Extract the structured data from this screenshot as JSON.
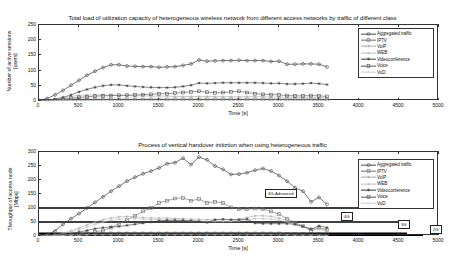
{
  "figure": {
    "background": "#ffffff",
    "axis_color": "#333333",
    "series_colors": {
      "aggregated": "#4a4a4a",
      "iptv": "#6f6f6f",
      "voip": "#a8a8a8",
      "web": "#bdbdbd",
      "videoconference": "#3a3a3a",
      "voice": "#555555",
      "vod": "#cccccc"
    }
  },
  "legend_labels": [
    "Aggregated traffic",
    "IPTV",
    "VoIP",
    "WEB",
    "Videoconference",
    "Voice",
    "VoD"
  ],
  "chart_data": [
    {
      "id": "top",
      "type": "line",
      "title": "Total load of utilization capacity of heterogeneous wireless network from different access networks by traffic of different class",
      "xlabel": "Time [s]",
      "ylabel": "Number of active sessions [users]",
      "ylabel_line1": "Number of active sessions",
      "ylabel_line2": "[users]",
      "xlim": [
        0,
        5000
      ],
      "ylim": [
        0,
        250
      ],
      "xticks": [
        0,
        500,
        1000,
        1500,
        2000,
        2500,
        3000,
        3500,
        4000,
        4500,
        5000
      ],
      "yticks": [
        0,
        50,
        100,
        150,
        200,
        250
      ],
      "grid": false,
      "legend_position": "upper right",
      "x": [
        0,
        100,
        200,
        300,
        400,
        500,
        600,
        700,
        800,
        900,
        1000,
        1100,
        1200,
        1300,
        1400,
        1500,
        1600,
        1700,
        1800,
        1900,
        2000,
        2100,
        2200,
        2300,
        2400,
        2500,
        2600,
        2700,
        2800,
        2900,
        3000,
        3100,
        3200,
        3300,
        3400,
        3500,
        3600
      ],
      "series": [
        {
          "name": "Aggregated traffic",
          "marker": "circle",
          "values": [
            2,
            8,
            20,
            35,
            52,
            68,
            85,
            98,
            110,
            119,
            119,
            115,
            114,
            113,
            113,
            111,
            112,
            113,
            117,
            122,
            135,
            131,
            132,
            133,
            133,
            134,
            133,
            133,
            133,
            130,
            131,
            121,
            121,
            122,
            122,
            121,
            112
          ]
        },
        {
          "name": "IPTV",
          "marker": "square",
          "values": [
            0,
            1,
            1,
            2,
            2,
            3,
            3,
            4,
            4,
            4,
            4,
            4,
            4,
            4,
            4,
            4,
            4,
            5,
            5,
            5,
            5,
            5,
            5,
            5,
            5,
            5,
            5,
            5,
            5,
            5,
            5,
            4,
            4,
            4,
            4,
            4,
            3
          ]
        },
        {
          "name": "VoIP",
          "marker": "plus",
          "values": [
            0,
            2,
            5,
            10,
            15,
            18,
            20,
            20,
            20,
            19,
            18,
            18,
            17,
            17,
            16,
            16,
            16,
            15,
            15,
            15,
            15,
            15,
            14,
            14,
            14,
            14,
            14,
            14,
            14,
            13,
            13,
            12,
            12,
            12,
            12,
            12,
            10
          ]
        },
        {
          "name": "WEB",
          "marker": "plus",
          "values": [
            0,
            1,
            3,
            5,
            7,
            9,
            10,
            10,
            10,
            10,
            10,
            10,
            10,
            9,
            9,
            9,
            9,
            9,
            9,
            9,
            9,
            9,
            9,
            9,
            9,
            9,
            9,
            9,
            9,
            8,
            8,
            8,
            8,
            8,
            8,
            8,
            7
          ]
        },
        {
          "name": "Videoconference",
          "marker": "star",
          "values": [
            0,
            2,
            6,
            12,
            20,
            30,
            38,
            45,
            50,
            53,
            53,
            50,
            48,
            46,
            45,
            44,
            44,
            45,
            48,
            52,
            59,
            58,
            59,
            60,
            60,
            60,
            60,
            60,
            59,
            58,
            58,
            56,
            56,
            57,
            59,
            57,
            54
          ]
        },
        {
          "name": "Voice",
          "marker": "square-open",
          "values": [
            0,
            1,
            3,
            6,
            9,
            12,
            14,
            16,
            17,
            18,
            19,
            19,
            20,
            21,
            22,
            24,
            24,
            26,
            28,
            30,
            32,
            29,
            27,
            28,
            30,
            32,
            28,
            24,
            22,
            21,
            20,
            18,
            17,
            17,
            18,
            17,
            15
          ]
        },
        {
          "name": "VoD",
          "marker": "dot",
          "values": [
            0,
            0,
            1,
            1,
            2,
            2,
            2,
            2,
            2,
            2,
            2,
            2,
            2,
            2,
            2,
            2,
            2,
            2,
            2,
            2,
            2,
            2,
            2,
            2,
            2,
            2,
            2,
            2,
            2,
            2,
            2,
            2,
            2,
            2,
            2,
            2,
            1
          ]
        }
      ]
    },
    {
      "id": "bottom",
      "type": "line",
      "title": "Process of vertical handover initiztion when using heterogeneous traffic",
      "xlabel": "Time  [s]",
      "ylabel": "Throughput of access node [Mbps]",
      "ylabel_line1": "Throughput of access node",
      "ylabel_line2": "[Mbps]",
      "xlim": [
        0,
        5000
      ],
      "ylim": [
        0,
        300
      ],
      "xticks": [
        0,
        500,
        1000,
        1500,
        2000,
        2500,
        3000,
        3500,
        4000,
        4500,
        5000
      ],
      "yticks": [
        0,
        50,
        100,
        150,
        200,
        250,
        300
      ],
      "grid": false,
      "legend_position": "upper right",
      "threshold_lines": [
        {
          "label": "4G-Advanced",
          "value": 100,
          "x_end": 4200
        },
        {
          "label": "4G",
          "value": 50,
          "x_end": 4600
        },
        {
          "label": "3G",
          "value": 10,
          "x_end": 4600
        },
        {
          "label": "2G",
          "value": 2,
          "x_end": 4800
        }
      ],
      "x": [
        0,
        100,
        200,
        300,
        400,
        500,
        600,
        700,
        800,
        900,
        1000,
        1100,
        1200,
        1300,
        1400,
        1500,
        1600,
        1700,
        1800,
        1900,
        2000,
        2100,
        2200,
        2300,
        2400,
        2500,
        2600,
        2700,
        2800,
        2900,
        3000,
        3100,
        3200,
        3300,
        3400,
        3500,
        3600
      ],
      "series": [
        {
          "name": "Aggregated traffic",
          "marker": "circle",
          "values": [
            2,
            5,
            18,
            42,
            62,
            80,
            100,
            120,
            140,
            160,
            178,
            196,
            210,
            222,
            232,
            243,
            258,
            262,
            278,
            255,
            282,
            272,
            250,
            238,
            220,
            221,
            226,
            235,
            241,
            232,
            216,
            196,
            172,
            160,
            122,
            138,
            113
          ]
        },
        {
          "name": "IPTV",
          "marker": "square",
          "values": [
            0,
            1,
            2,
            4,
            6,
            8,
            10,
            14,
            20,
            30,
            44,
            58,
            72,
            88,
            100,
            118,
            126,
            134,
            136,
            126,
            132,
            118,
            122,
            118,
            102,
            96,
            96,
            98,
            96,
            88,
            78,
            62,
            48,
            35,
            18,
            30,
            22
          ]
        },
        {
          "name": "VoIP",
          "marker": "plus",
          "values": [
            0,
            1,
            4,
            10,
            18,
            28,
            40,
            50,
            58,
            64,
            68,
            70,
            68,
            66,
            64,
            64,
            64,
            62,
            62,
            60,
            60,
            58,
            58,
            58,
            58,
            60,
            66,
            72,
            72,
            70,
            64,
            56,
            44,
            34,
            28,
            26,
            20
          ]
        },
        {
          "name": "WEB",
          "marker": "plus",
          "values": [
            0,
            1,
            3,
            8,
            14,
            22,
            32,
            42,
            50,
            56,
            60,
            62,
            62,
            60,
            58,
            58,
            58,
            56,
            56,
            54,
            54,
            52,
            52,
            52,
            52,
            54,
            58,
            62,
            62,
            60,
            56,
            50,
            40,
            32,
            26,
            24,
            18
          ]
        },
        {
          "name": "Videoconference",
          "marker": "star",
          "values": [
            0,
            1,
            2,
            4,
            8,
            14,
            20,
            26,
            30,
            32,
            34,
            38,
            42,
            46,
            50,
            54,
            56,
            56,
            56,
            54,
            52,
            48,
            58,
            60,
            58,
            58,
            60,
            46,
            44,
            44,
            44,
            44,
            42,
            34,
            24,
            36,
            30
          ]
        },
        {
          "name": "Voice",
          "marker": "square-open",
          "values": [
            0,
            1,
            2,
            4,
            5,
            6,
            7,
            8,
            8,
            9,
            9,
            9,
            9,
            9,
            9,
            9,
            9,
            9,
            9,
            9,
            9,
            9,
            9,
            9,
            9,
            9,
            9,
            9,
            9,
            9,
            9,
            8,
            8,
            8,
            7,
            7,
            6
          ]
        },
        {
          "name": "VoD",
          "marker": "dot",
          "values": [
            0,
            0,
            1,
            2,
            3,
            3,
            4,
            4,
            4,
            4,
            4,
            4,
            4,
            4,
            4,
            4,
            4,
            4,
            4,
            4,
            4,
            4,
            4,
            4,
            4,
            4,
            4,
            4,
            4,
            4,
            4,
            4,
            3,
            3,
            3,
            3,
            2
          ]
        }
      ]
    }
  ]
}
